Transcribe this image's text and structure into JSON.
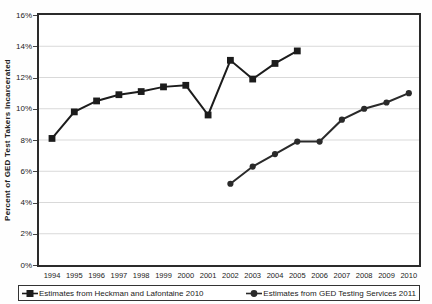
{
  "chart_data": {
    "type": "line",
    "title": "",
    "xlabel": "",
    "ylabel": "Percent of GED Test Takers Incarcerated",
    "ylim": [
      0,
      16
    ],
    "grid": true,
    "legend_position": "bottom",
    "categories": [
      1994,
      1995,
      1996,
      1997,
      1998,
      1999,
      2000,
      2001,
      2002,
      2003,
      2004,
      2005,
      2006,
      2007,
      2008,
      2009,
      2010
    ],
    "yticks": [
      "0%",
      "2%",
      "4%",
      "6%",
      "8%",
      "10%",
      "12%",
      "14%",
      "16%"
    ],
    "ytick_values": [
      0,
      2,
      4,
      6,
      8,
      10,
      12,
      14,
      16
    ],
    "series": [
      {
        "name": "Estimates from Heckman and Lafontaine 2010",
        "marker": "square",
        "color": "#1c1c1c",
        "x": [
          1994,
          1995,
          1996,
          1997,
          1998,
          1999,
          2000,
          2001,
          2002,
          2003,
          2004,
          2005
        ],
        "values": [
          8.1,
          9.8,
          10.5,
          10.9,
          11.1,
          11.4,
          11.5,
          9.6,
          13.1,
          11.9,
          12.9,
          13.7
        ]
      },
      {
        "name": "Estimates from GED Testing Services 2011",
        "marker": "circle",
        "color": "#2a2a2a",
        "x": [
          2002,
          2003,
          2004,
          2005,
          2006,
          2007,
          2008,
          2009,
          2010
        ],
        "values": [
          5.2,
          6.3,
          7.1,
          7.9,
          7.9,
          9.3,
          10.0,
          10.4,
          11.0
        ]
      }
    ]
  },
  "colors": {
    "background": "#ffffff",
    "axis": "#2b2b2b",
    "grid": "#d9d9d9",
    "text": "#1a1a1a"
  }
}
